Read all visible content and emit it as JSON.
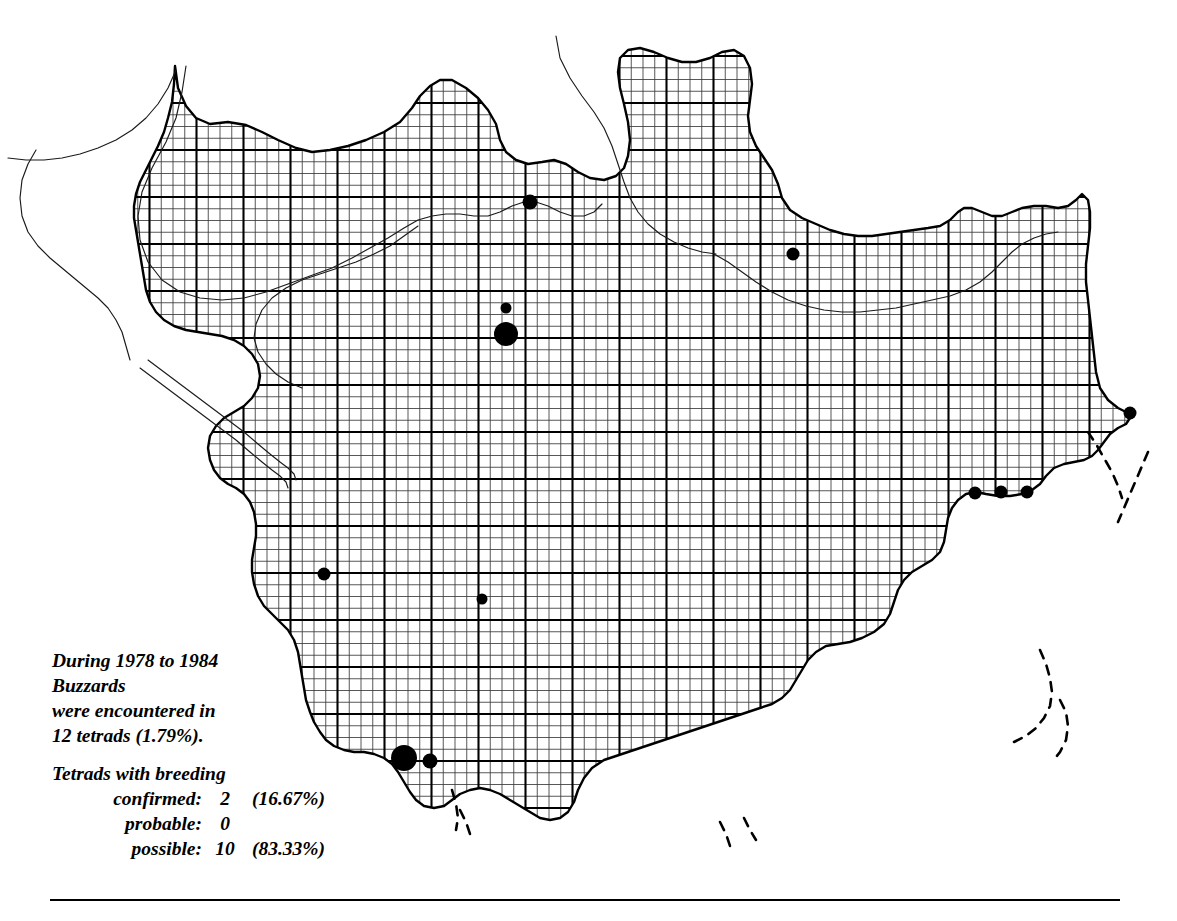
{
  "caption": {
    "line1": "During 1978 to 1984",
    "line2": "Buzzards",
    "line3": "were encountered in",
    "line4": "12 tetrads (1.79%).",
    "heading": "Tetrads with breeding",
    "rows": [
      {
        "label": "confirmed:",
        "count": "2",
        "percent": "(16.67%)"
      },
      {
        "label": "probable:",
        "count": "0",
        "percent": ""
      },
      {
        "label": "possible:",
        "count": "10",
        "percent": "(83.33%)"
      }
    ]
  },
  "chart_data": {
    "type": "scatter",
    "subject": "Buzzards",
    "survey_period": "1978 to 1984",
    "tetrads_occupied": 12,
    "tetrads_percent": 1.79,
    "breeding_status": {
      "confirmed": {
        "count": 2,
        "percent": 16.67,
        "symbol": "large-dot"
      },
      "probable": {
        "count": 0,
        "percent": null,
        "symbol": "medium-dot"
      },
      "possible": {
        "count": 10,
        "percent": 83.33,
        "symbol": "small-dot"
      }
    },
    "legend_position": "none",
    "grid": {
      "tetrad_px": 11.75,
      "tenkm_px": 47,
      "origin_x": 8.5,
      "origin_y": 9.0,
      "note": "fine lines = 2km tetrads, bold lines = 10km squares"
    },
    "dots": [
      {
        "x": 530,
        "y": 202,
        "r": 7.5,
        "status": "possible"
      },
      {
        "x": 793,
        "y": 254,
        "r": 6.5,
        "status": "possible"
      },
      {
        "x": 506,
        "y": 308,
        "r": 5.5,
        "status": "possible"
      },
      {
        "x": 506,
        "y": 334,
        "r": 12.0,
        "status": "confirmed"
      },
      {
        "x": 1130,
        "y": 413,
        "r": 6.5,
        "status": "possible"
      },
      {
        "x": 975,
        "y": 493,
        "r": 6.5,
        "status": "possible"
      },
      {
        "x": 1001,
        "y": 492,
        "r": 6.5,
        "status": "possible"
      },
      {
        "x": 1027,
        "y": 492,
        "r": 6.5,
        "status": "possible"
      },
      {
        "x": 324,
        "y": 574,
        "r": 6.5,
        "status": "possible"
      },
      {
        "x": 482,
        "y": 599,
        "r": 5.5,
        "status": "possible"
      },
      {
        "x": 404,
        "y": 758,
        "r": 13.0,
        "status": "confirmed"
      },
      {
        "x": 430,
        "y": 761,
        "r": 7.5,
        "status": "possible"
      }
    ],
    "colors": {
      "ink": "#000000",
      "background": "#ffffff",
      "grid_fine": "#3a3a3a",
      "grid_bold": "#000000"
    }
  }
}
